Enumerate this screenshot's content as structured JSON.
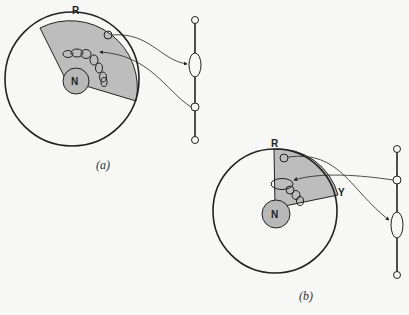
{
  "figure": {
    "panels": [
      {
        "id": "a",
        "caption": "(a)",
        "labels": {
          "top": "R",
          "nucleus": "N"
        }
      },
      {
        "id": "b",
        "caption": "(b)",
        "labels": {
          "top": "R",
          "side": "Y",
          "nucleus": "N"
        }
      }
    ],
    "colors": {
      "background": "#f7f7f5",
      "line": "#222222",
      "shade": "#bdbdbd",
      "nucleus_fill": "#b8b8b8"
    }
  }
}
